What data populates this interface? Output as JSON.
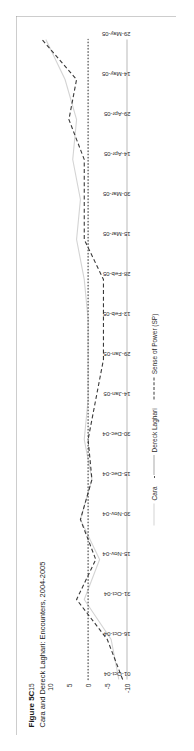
{
  "figure": {
    "title": "Figure 5C",
    "subtitle": "Cara and Dereck Laghari: Encounters, 2004-2005"
  },
  "legend": {
    "position": "bottom-center",
    "items": [
      {
        "label": "Cara",
        "style": "solid",
        "color": "#d4d4d4"
      },
      {
        "label": "Dereck Laghari",
        "style": "dotted",
        "color": "#555555"
      },
      {
        "label": "Sense of Power (SP)",
        "style": "dashed",
        "color": "#3a3a3a"
      }
    ]
  },
  "chart_data": {
    "type": "line",
    "title": "Figure 5C",
    "subtitle": "Cara and Dereck Laghari: Encounters, 2004-2005",
    "xlabel": "",
    "ylabel": "",
    "ylim": [
      -10,
      15
    ],
    "yticks": [
      15,
      10,
      5,
      0,
      -5,
      -10
    ],
    "grid": false,
    "orientation": "rotated-90-ccw",
    "x": [
      "01-Oct-04",
      "16-Oct-04",
      "31-Oct-04",
      "15-Nov-04",
      "30-Nov-04",
      "15-Dec-04",
      "30-Dec-04",
      "14-Jan-05",
      "29-Jan-05",
      "13-Feb-05",
      "28-Feb-05",
      "15-Mar-05",
      "30-Mar-05",
      "14-Apr-05",
      "29-Apr-05",
      "14-May-05",
      "29-May-05"
    ],
    "series": [
      {
        "name": "Cara",
        "style": "solid",
        "color": "#d4d4d4",
        "values": [
          -8,
          -6,
          1,
          -3,
          2,
          -1,
          1,
          0,
          0,
          0,
          1,
          3,
          2,
          4,
          3,
          6,
          11
        ]
      },
      {
        "name": "Dereck Laghari",
        "style": "dotted",
        "color": "#555555",
        "values": [
          0,
          0,
          0,
          0,
          0,
          0,
          0,
          0,
          0,
          0,
          0,
          0,
          0,
          0,
          0,
          0,
          0
        ]
      },
      {
        "name": "Sense of Power (SP)",
        "style": "dashed",
        "color": "#3a3a3a",
        "values": [
          -9,
          -5,
          3,
          -2,
          2,
          -1,
          0,
          -2,
          -4,
          -4,
          -4,
          1,
          1,
          1,
          5,
          3,
          12
        ]
      }
    ]
  }
}
